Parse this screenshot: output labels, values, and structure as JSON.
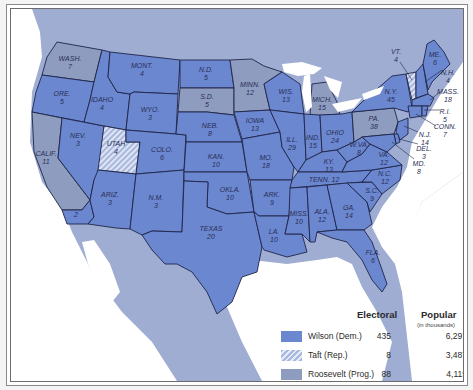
{
  "map": {
    "title": "1912 Presidential Election",
    "colors": {
      "wilson": "#6b87d0",
      "taft": "#a8b7de",
      "roosevelt": "#8e9cbf",
      "water": "#ffffff",
      "foreign_land": "#9fadd3",
      "border": "#1f2548"
    },
    "states": [
      {
        "abbr": "WASH.",
        "ev": "7",
        "winner": "roosevelt"
      },
      {
        "abbr": "ORE.",
        "ev": "5",
        "winner": "wilson"
      },
      {
        "abbr": "CALIF.",
        "ev": "11",
        "winner": "roosevelt"
      },
      {
        "abbr": "CALIF. (Wilson)",
        "ev": "2",
        "winner": "wilson"
      },
      {
        "abbr": "IDAHO",
        "ev": "4",
        "winner": "wilson"
      },
      {
        "abbr": "NEV.",
        "ev": "3",
        "winner": "wilson"
      },
      {
        "abbr": "UTAH",
        "ev": "4",
        "winner": "taft"
      },
      {
        "abbr": "ARIZ.",
        "ev": "3",
        "winner": "wilson"
      },
      {
        "abbr": "MONT.",
        "ev": "4",
        "winner": "wilson"
      },
      {
        "abbr": "WYO.",
        "ev": "3",
        "winner": "wilson"
      },
      {
        "abbr": "COLO.",
        "ev": "6",
        "winner": "wilson"
      },
      {
        "abbr": "N.M.",
        "ev": "3",
        "winner": "wilson"
      },
      {
        "abbr": "N.D.",
        "ev": "5",
        "winner": "wilson"
      },
      {
        "abbr": "S.D.",
        "ev": "5",
        "winner": "roosevelt"
      },
      {
        "abbr": "NEB.",
        "ev": "8",
        "winner": "wilson"
      },
      {
        "abbr": "KAN.",
        "ev": "10",
        "winner": "wilson"
      },
      {
        "abbr": "OKLA.",
        "ev": "10",
        "winner": "wilson"
      },
      {
        "abbr": "TEXAS",
        "ev": "20",
        "winner": "wilson"
      },
      {
        "abbr": "MINN.",
        "ev": "12",
        "winner": "roosevelt"
      },
      {
        "abbr": "IOWA",
        "ev": "13",
        "winner": "wilson"
      },
      {
        "abbr": "MO.",
        "ev": "18",
        "winner": "wilson"
      },
      {
        "abbr": "ARK.",
        "ev": "9",
        "winner": "wilson"
      },
      {
        "abbr": "LA.",
        "ev": "10",
        "winner": "wilson"
      },
      {
        "abbr": "WIS.",
        "ev": "13",
        "winner": "wilson"
      },
      {
        "abbr": "ILL.",
        "ev": "29",
        "winner": "wilson"
      },
      {
        "abbr": "MICH.",
        "ev": "15",
        "winner": "roosevelt"
      },
      {
        "abbr": "IND.",
        "ev": "15",
        "winner": "wilson"
      },
      {
        "abbr": "OHIO",
        "ev": "24",
        "winner": "wilson"
      },
      {
        "abbr": "KY.",
        "ev": "13",
        "winner": "wilson"
      },
      {
        "abbr": "TENN.",
        "ev": "12",
        "winner": "wilson"
      },
      {
        "abbr": "MISS.",
        "ev": "10",
        "winner": "wilson"
      },
      {
        "abbr": "ALA.",
        "ev": "12",
        "winner": "wilson"
      },
      {
        "abbr": "GA.",
        "ev": "14",
        "winner": "wilson"
      },
      {
        "abbr": "FLA.",
        "ev": "6",
        "winner": "wilson"
      },
      {
        "abbr": "S.C.",
        "ev": "9",
        "winner": "wilson"
      },
      {
        "abbr": "N.C.",
        "ev": "12",
        "winner": "wilson"
      },
      {
        "abbr": "VA.",
        "ev": "12",
        "winner": "wilson"
      },
      {
        "abbr": "W.VA.",
        "ev": "8",
        "winner": "wilson"
      },
      {
        "abbr": "PA.",
        "ev": "38",
        "winner": "roosevelt"
      },
      {
        "abbr": "N.Y.",
        "ev": "45",
        "winner": "wilson"
      },
      {
        "abbr": "VT.",
        "ev": "4",
        "winner": "taft"
      },
      {
        "abbr": "N.H.",
        "ev": "4",
        "winner": "wilson"
      },
      {
        "abbr": "ME.",
        "ev": "6",
        "winner": "wilson"
      },
      {
        "abbr": "MASS.",
        "ev": "18",
        "winner": "wilson"
      },
      {
        "abbr": "R.I.",
        "ev": "5",
        "winner": "wilson"
      },
      {
        "abbr": "CONN.",
        "ev": "7",
        "winner": "wilson"
      },
      {
        "abbr": "N.J.",
        "ev": "14",
        "winner": "wilson"
      },
      {
        "abbr": "DEL.",
        "ev": "3",
        "winner": "wilson"
      },
      {
        "abbr": "MD.",
        "ev": "8",
        "winner": "wilson"
      }
    ]
  },
  "labels": {
    "wash": [
      "WASH.",
      "7"
    ],
    "ore": [
      "ORE.",
      "5"
    ],
    "calif": [
      "CALIF.",
      "11"
    ],
    "calif2": "2",
    "idaho": [
      "IDAHO",
      "4"
    ],
    "nev": [
      "NEV.",
      "3"
    ],
    "utah": [
      "UTAH",
      "4"
    ],
    "ariz": [
      "ARIZ.",
      "3"
    ],
    "mont": [
      "MONT.",
      "4"
    ],
    "wyo": [
      "WYO.",
      "3"
    ],
    "colo": [
      "COLO.",
      "6"
    ],
    "nm": [
      "N.M.",
      "3"
    ],
    "nd": [
      "N.D.",
      "5"
    ],
    "sd": [
      "S.D.",
      "5"
    ],
    "neb": [
      "NEB.",
      "8"
    ],
    "kan": [
      "KAN.",
      "10"
    ],
    "okla": [
      "OKLA.",
      "10"
    ],
    "texas": [
      "TEXAS",
      "20"
    ],
    "minn": [
      "MINN.",
      "12"
    ],
    "iowa": [
      "IOWA",
      "13"
    ],
    "mo": [
      "MO.",
      "18"
    ],
    "ark": [
      "ARK.",
      "9"
    ],
    "la": [
      "LA.",
      "10"
    ],
    "wis": [
      "WIS.",
      "13"
    ],
    "ill": [
      "ILL.",
      "29"
    ],
    "mich": [
      "MICH.",
      "15"
    ],
    "ind": [
      "IND.",
      "15"
    ],
    "ohio": [
      "OHIO",
      "24"
    ],
    "ky": [
      "KY.",
      "13"
    ],
    "tenn": "TENN. 12",
    "miss": [
      "MISS.",
      "10"
    ],
    "ala": [
      "ALA.",
      "12"
    ],
    "ga": [
      "GA.",
      "14"
    ],
    "fla": [
      "FLA.",
      "6"
    ],
    "sc": [
      "S.C.",
      "9"
    ],
    "nc": [
      "N.C.",
      "12"
    ],
    "va": [
      "VA.",
      "12"
    ],
    "wva": [
      "W.VA.",
      "8"
    ],
    "pa": [
      "PA.",
      "38"
    ],
    "ny": [
      "N.Y.",
      "45"
    ],
    "vt": [
      "VT.",
      "4"
    ],
    "nh": [
      "N.H.",
      "4"
    ],
    "me": [
      "ME.",
      "6"
    ],
    "mass": [
      "MASS.",
      "18"
    ],
    "ri": [
      "R.I.",
      "5"
    ],
    "conn": [
      "CONN.",
      "7"
    ],
    "nj": [
      "N.J.",
      "14"
    ],
    "del": [
      "DEL.",
      "3"
    ],
    "md": [
      "MD.",
      "8"
    ]
  },
  "legend": {
    "col_electoral": "Electoral",
    "col_popular": "Popular",
    "popular_unit": "(in thousands)",
    "rows": [
      {
        "name": "Wilson (Dem.)",
        "electoral": "435",
        "popular": "6,297",
        "swatch": "wilson"
      },
      {
        "name": "Taft (Rep.)",
        "electoral": "8",
        "popular": "3,487",
        "swatch": "taft"
      },
      {
        "name": "Roosevelt (Prog.)",
        "electoral": "88",
        "popular": "4,119",
        "swatch": "roosevelt"
      }
    ]
  }
}
